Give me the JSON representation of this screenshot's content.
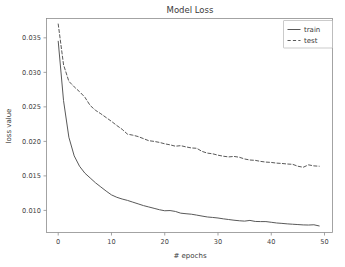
{
  "chart_data": {
    "type": "line",
    "title": "Model Loss",
    "xlabel": "# epochs",
    "ylabel": "loss value",
    "xlim": [
      -2.2,
      51.5
    ],
    "ylim": [
      0.0068,
      0.0378
    ],
    "xticks": [
      0,
      10,
      20,
      30,
      40,
      50
    ],
    "xticklabels": [
      "0",
      "10",
      "20",
      "30",
      "40",
      "50"
    ],
    "yticks": [
      0.01,
      0.015,
      0.02,
      0.025,
      0.03,
      0.035
    ],
    "yticklabels": [
      "0.010",
      "0.015",
      "0.020",
      "0.025",
      "0.030",
      "0.035"
    ],
    "grid": false,
    "legend_position": "upper right",
    "line_color": "#595959",
    "x": [
      0,
      1,
      2,
      3,
      4,
      5,
      6,
      7,
      8,
      9,
      10,
      11,
      12,
      13,
      14,
      15,
      16,
      17,
      18,
      19,
      20,
      21,
      22,
      23,
      24,
      25,
      26,
      27,
      28,
      29,
      30,
      31,
      32,
      33,
      34,
      35,
      36,
      37,
      38,
      39,
      40,
      41,
      42,
      43,
      44,
      45,
      46,
      47,
      48,
      49
    ],
    "series": [
      {
        "name": "train",
        "style": "solid",
        "values": [
          0.0345,
          0.0259,
          0.0206,
          0.0179,
          0.0164,
          0.0154,
          0.0147,
          0.014,
          0.0134,
          0.0128,
          0.01225,
          0.0119,
          0.01165,
          0.01145,
          0.0112,
          0.01095,
          0.0107,
          0.0105,
          0.0103,
          0.0101,
          0.00995,
          0.00998,
          0.00985,
          0.0096,
          0.00952,
          0.00945,
          0.00932,
          0.00918,
          0.00905,
          0.00898,
          0.0089,
          0.00878,
          0.00868,
          0.00858,
          0.0085,
          0.00845,
          0.00855,
          0.0084,
          0.00838,
          0.00838,
          0.00828,
          0.00818,
          0.00812,
          0.00805,
          0.008,
          0.00795,
          0.0079,
          0.00788,
          0.00792,
          0.00775
        ]
      },
      {
        "name": "test",
        "style": "dashed",
        "values": [
          0.037,
          0.0311,
          0.0287,
          0.0279,
          0.0272,
          0.0264,
          0.0252,
          0.0245,
          0.024,
          0.02345,
          0.0229,
          0.0223,
          0.02175,
          0.02105,
          0.0209,
          0.0207,
          0.0204,
          0.0201,
          0.02,
          0.01985,
          0.01965,
          0.0195,
          0.0193,
          0.01938,
          0.0192,
          0.01905,
          0.019,
          0.01855,
          0.0183,
          0.0182,
          0.018,
          0.01785,
          0.01775,
          0.01782,
          0.0177,
          0.01745,
          0.0173,
          0.01725,
          0.0171,
          0.017,
          0.01695,
          0.01685,
          0.0168,
          0.01672,
          0.01668,
          0.0164,
          0.01625,
          0.0166,
          0.01645,
          0.0164
        ]
      }
    ]
  },
  "legend": {
    "entries": [
      {
        "label": "train"
      },
      {
        "label": "test"
      }
    ]
  }
}
